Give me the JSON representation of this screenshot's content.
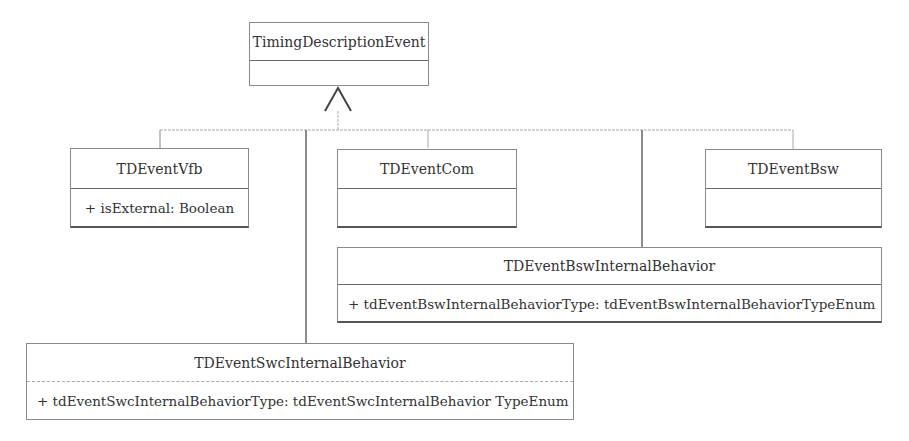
{
  "diagram": {
    "type": "uml-class-diagram",
    "relationship": "generalization",
    "parent": {
      "name": "TimingDescriptionEvent",
      "attributes": []
    },
    "children": [
      {
        "id": "vfb",
        "name": "TDEventVfb",
        "attributes": [
          "+ isExternal: Boolean"
        ]
      },
      {
        "id": "com",
        "name": "TDEventCom",
        "attributes": []
      },
      {
        "id": "bsw",
        "name": "TDEventBsw",
        "attributes": []
      },
      {
        "id": "bswib",
        "name": "TDEventBswInternalBehavior",
        "attributes": [
          "+ tdEventBswInternalBehaviorType: tdEventBswInternalBehaviorTypeEnum"
        ]
      },
      {
        "id": "swcib",
        "name": "TDEventSwcInternalBehavior",
        "attributes": [
          "+ tdEventSwcInternalBehaviorType: tdEventSwcInternalBehavior TypeEnum"
        ]
      }
    ]
  }
}
